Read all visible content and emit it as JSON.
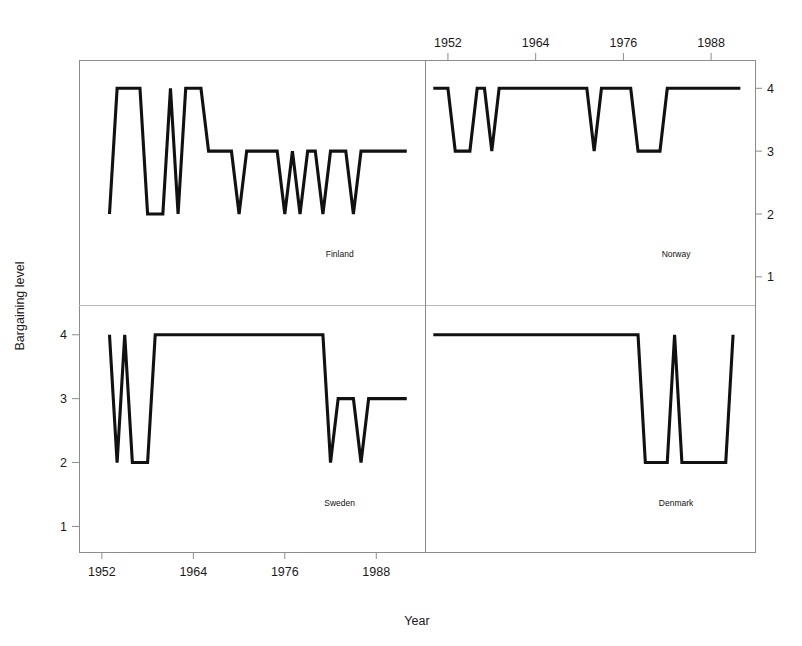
{
  "figure": {
    "width": 802,
    "height": 646,
    "background": "#ffffff",
    "line_color": "#111111",
    "frame_color": "#8c8c8c"
  },
  "axes": {
    "xlabel": "Year",
    "ylabel": "Bargaining level",
    "xticks": [
      1952,
      1964,
      1976,
      1988
    ],
    "xtick_labels": [
      "1952",
      "1964",
      "1976",
      "1988"
    ],
    "yticks": [
      1,
      2,
      3,
      4
    ],
    "ytick_labels": [
      "1",
      "2",
      "3",
      "4"
    ],
    "xlim": [
      1949,
      1994
    ],
    "ylim": [
      0.6,
      4.45
    ],
    "x_axis_positions": [
      "bottom-left",
      "top-right"
    ],
    "y_axis_positions": [
      "left-bottom",
      "right-top"
    ],
    "grid": false,
    "legend": "none"
  },
  "chart_data": {
    "type": "line",
    "title": "",
    "xlabel": "Year",
    "ylabel": "Bargaining level",
    "xlim": [
      1949,
      1994
    ],
    "ylim": [
      0.6,
      4.45
    ],
    "grid": false,
    "legend": "none",
    "step_style": "linear-interpolated",
    "panels": [
      {
        "name": "Finland",
        "row": 0,
        "col": 0,
        "x_axis": "bottom",
        "y_axis": "left",
        "x": [
          1953,
          1954,
          1955,
          1956,
          1957,
          1958,
          1959,
          1960,
          1961,
          1962,
          1963,
          1964,
          1965,
          1966,
          1967,
          1968,
          1969,
          1970,
          1971,
          1972,
          1973,
          1974,
          1975,
          1976,
          1977,
          1978,
          1979,
          1980,
          1981,
          1982,
          1983,
          1984,
          1985,
          1986,
          1987,
          1988,
          1989,
          1990,
          1991,
          1992
        ],
        "y": [
          2,
          4,
          4,
          4,
          4,
          2,
          2,
          2,
          4,
          2,
          4,
          4,
          4,
          3,
          3,
          3,
          3,
          2,
          3,
          3,
          3,
          3,
          3,
          2,
          3,
          2,
          3,
          3,
          2,
          3,
          3,
          3,
          2,
          3,
          3,
          3,
          3,
          3,
          3,
          3
        ]
      },
      {
        "name": "Norway",
        "row": 0,
        "col": 1,
        "x_axis": "top",
        "y_axis": "right",
        "x": [
          1950,
          1951,
          1952,
          1953,
          1954,
          1955,
          1956,
          1957,
          1958,
          1959,
          1960,
          1961,
          1962,
          1963,
          1964,
          1965,
          1966,
          1967,
          1968,
          1969,
          1970,
          1971,
          1972,
          1973,
          1974,
          1975,
          1976,
          1977,
          1978,
          1979,
          1980,
          1981,
          1982,
          1983,
          1984,
          1985,
          1986,
          1987,
          1988,
          1989,
          1990,
          1991,
          1992
        ],
        "y": [
          4,
          4,
          4,
          3,
          3,
          3,
          4,
          4,
          3,
          4,
          4,
          4,
          4,
          4,
          4,
          4,
          4,
          4,
          4,
          4,
          4,
          4,
          3,
          4,
          4,
          4,
          4,
          4,
          3,
          3,
          3,
          3,
          4,
          4,
          4,
          4,
          4,
          4,
          4,
          4,
          4,
          4,
          4
        ]
      },
      {
        "name": "Sweden",
        "row": 1,
        "col": 0,
        "x_axis": "bottom",
        "y_axis": "left",
        "x": [
          1953,
          1954,
          1955,
          1956,
          1957,
          1958,
          1959,
          1960,
          1961,
          1962,
          1963,
          1964,
          1965,
          1966,
          1967,
          1968,
          1969,
          1970,
          1971,
          1972,
          1973,
          1974,
          1975,
          1976,
          1977,
          1978,
          1979,
          1980,
          1981,
          1982,
          1983,
          1984,
          1985,
          1986,
          1987,
          1988,
          1989,
          1990,
          1991,
          1992
        ],
        "y": [
          4,
          2,
          4,
          2,
          2,
          2,
          4,
          4,
          4,
          4,
          4,
          4,
          4,
          4,
          4,
          4,
          4,
          4,
          4,
          4,
          4,
          4,
          4,
          4,
          4,
          4,
          4,
          4,
          4,
          2,
          3,
          3,
          3,
          2,
          3,
          3,
          3,
          3,
          3,
          3
        ]
      },
      {
        "name": "Denmark",
        "row": 1,
        "col": 1,
        "x_axis": "bottom",
        "y_axis": "right",
        "x": [
          1950,
          1951,
          1952,
          1953,
          1954,
          1955,
          1956,
          1957,
          1958,
          1959,
          1960,
          1961,
          1962,
          1963,
          1964,
          1965,
          1966,
          1967,
          1968,
          1969,
          1970,
          1971,
          1972,
          1973,
          1974,
          1975,
          1976,
          1977,
          1978,
          1979,
          1980,
          1981,
          1982,
          1983,
          1984,
          1985,
          1986,
          1987,
          1988,
          1989,
          1990,
          1991
        ],
        "y": [
          4,
          4,
          4,
          4,
          4,
          4,
          4,
          4,
          4,
          4,
          4,
          4,
          4,
          4,
          4,
          4,
          4,
          4,
          4,
          4,
          4,
          4,
          4,
          4,
          4,
          4,
          4,
          4,
          4,
          2,
          2,
          2,
          2,
          4,
          2,
          2,
          2,
          2,
          2,
          2,
          2,
          4
        ]
      }
    ]
  }
}
